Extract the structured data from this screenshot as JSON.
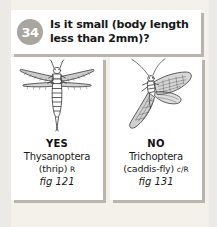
{
  "page": {
    "background_color": "#f4f1eb",
    "card_color": "#ffffff",
    "shadow_color": "#b9b5ae"
  },
  "question": {
    "number": "34",
    "badge_color": "#a9a6a1",
    "line1": "Is it small (body length",
    "line2": "less than 2mm)?"
  },
  "answers": [
    {
      "verdict": "YES",
      "taxon": "Thysanoptera",
      "common": "(thrip)",
      "abbr": "R",
      "figref": "fig 121",
      "illustration": "thrips-dorsal-drawing"
    },
    {
      "verdict": "NO",
      "taxon": "Trichoptera",
      "common": "(caddis-fly)",
      "abbr": "c/R",
      "figref": "fig 131",
      "illustration": "caddisfly-drawing"
    }
  ]
}
